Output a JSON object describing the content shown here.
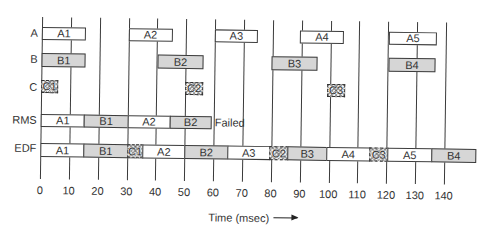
{
  "scale": {
    "origin_px": 41,
    "px_per_ms": 2.885
  },
  "colors": {
    "task_a_fill": "#ffffff",
    "task_b_fill": "#d6d6d6",
    "task_c_hatch": "#333333",
    "border": "#3c3c3c",
    "grid": "#3a3a3a"
  },
  "axis": {
    "label": "Time (msec)",
    "arrow": "→",
    "ticks": [
      0,
      10,
      20,
      30,
      40,
      50,
      60,
      70,
      80,
      90,
      100,
      110,
      120,
      130,
      140
    ],
    "tick_labels": [
      "0",
      "10",
      "20",
      "30",
      "40",
      "50",
      "60",
      "70",
      "80",
      "90",
      "100",
      "110",
      "120",
      "130",
      "140"
    ]
  },
  "rows": {
    "a": {
      "label": "A",
      "bars": [
        {
          "label": "A1",
          "start": 0,
          "end": 15
        },
        {
          "label": "A2",
          "start": 30,
          "end": 45
        },
        {
          "label": "A3",
          "start": 60,
          "end": 74.5
        },
        {
          "label": "A4",
          "start": 89.5,
          "end": 104.3
        },
        {
          "label": "A5",
          "start": 120.3,
          "end": 136.6
        }
      ]
    },
    "b": {
      "label": "B",
      "bars": [
        {
          "label": "B1",
          "start": 0,
          "end": 15
        },
        {
          "label": "B2",
          "start": 40.2,
          "end": 55.8
        },
        {
          "label": "B3",
          "start": 79.7,
          "end": 95.3
        },
        {
          "label": "B4",
          "start": 120.3,
          "end": 136.2
        }
      ]
    },
    "c": {
      "label": "C",
      "bars": [
        {
          "label": "C1",
          "start": 0,
          "end": 5.5
        },
        {
          "label": "C2",
          "start": 49.9,
          "end": 55.8
        },
        {
          "label": "C3",
          "start": 99.1,
          "end": 105
        }
      ]
    },
    "rms": {
      "label": "RMS",
      "status": "Failed",
      "bars": [
        {
          "label": "A1",
          "start": 0,
          "end": 15
        },
        {
          "label": "B1",
          "start": 15,
          "end": 30
        },
        {
          "label": "A2",
          "start": 30,
          "end": 44.7
        },
        {
          "label": "B2",
          "start": 44.7,
          "end": 58.9
        }
      ]
    },
    "edf": {
      "label": "EDF",
      "bars": [
        {
          "label": "A1",
          "start": 0,
          "end": 15
        },
        {
          "label": "B1",
          "start": 15,
          "end": 30
        },
        {
          "label": "C1",
          "start": 30,
          "end": 35.4
        },
        {
          "label": "A2",
          "start": 35.4,
          "end": 49.9
        },
        {
          "label": "B2",
          "start": 49.9,
          "end": 64.8
        },
        {
          "label": "A3",
          "start": 64.8,
          "end": 79.4
        },
        {
          "label": "C2",
          "start": 79.4,
          "end": 85.6
        },
        {
          "label": "B3",
          "start": 85.6,
          "end": 99.1
        },
        {
          "label": "A4",
          "start": 99.1,
          "end": 114
        },
        {
          "label": "C3",
          "start": 114,
          "end": 120.3
        },
        {
          "label": "A5",
          "start": 120.3,
          "end": 135.5
        },
        {
          "label": "B4",
          "start": 135.5,
          "end": 150.8
        }
      ]
    }
  }
}
